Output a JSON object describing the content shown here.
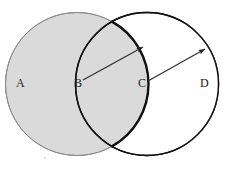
{
  "figure": {
    "title": "",
    "background_color": "#ffffff",
    "width": 229,
    "height": 169
  },
  "labels": {
    "a": "A",
    "b": "B",
    "c": "C",
    "d": "D"
  },
  "colors": {
    "gray_fill": "#dadada",
    "gray_stroke": "#8c8c8c",
    "black_stroke": "#111111",
    "thin_stroke": "#3a3a3a",
    "label_color": "#1a1a1a",
    "speck": "#cfcfcf"
  },
  "chart_data": {
    "type": "diagram",
    "shapes": [
      {
        "name": "left-circle",
        "kind": "circle",
        "center_label": "B",
        "region_label": "A",
        "cx": 77,
        "cy": 84,
        "r": 72,
        "fill": "#dadada",
        "stroke": "#8c8c8c",
        "stroke_width": 1
      },
      {
        "name": "right-circle",
        "kind": "circle",
        "center_label": "C",
        "region_label": "D",
        "cx": 147,
        "cy": 84,
        "r": 72,
        "fill": "none",
        "stroke": "#111111",
        "stroke_width": 1
      }
    ],
    "arrows": [
      {
        "name": "left-radius-arrow",
        "from_label": "B",
        "from": [
          83,
          80
        ],
        "to": [
          143,
          47
        ],
        "length_is_radius": true
      },
      {
        "name": "right-radius-arrow",
        "from_label": "C",
        "from": [
          148,
          81
        ],
        "to": [
          205,
          49
        ],
        "length_is_radius": true
      }
    ],
    "annotations": [
      "A",
      "B",
      "C",
      "D"
    ],
    "grid": false,
    "legend": null
  }
}
